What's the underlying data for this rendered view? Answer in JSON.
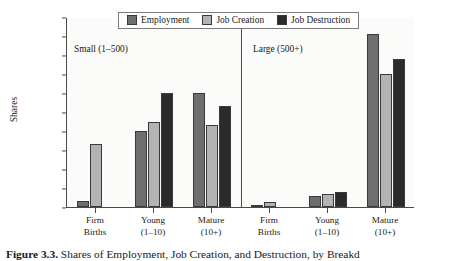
{
  "chart_data": {
    "type": "bar",
    "title": "",
    "xlabel": "",
    "ylabel": "Shares",
    "ylim": [
      0.0,
      0.5
    ],
    "ytick_step": 0.05,
    "yticks": [
      "0.50",
      "0.45",
      "0.40",
      "0.35",
      "0.30",
      "0.25",
      "0.20",
      "0.15",
      "0.10",
      "0.05",
      "0.00"
    ],
    "grid": false,
    "legend_position": "top-center",
    "legend": [
      "Employment",
      "Job Creation",
      "Job Destruction"
    ],
    "panels": [
      {
        "name": "Small (1–500)",
        "categories": [
          "Firm\nBirths",
          "Young\n(1–10)",
          "Mature\n(10+)"
        ],
        "series": [
          {
            "name": "Employment",
            "values": [
              0.015,
              0.2,
              0.3
            ]
          },
          {
            "name": "Job Creation",
            "values": [
              0.165,
              0.225,
              0.215
            ]
          },
          {
            "name": "Job Destruction",
            "values": [
              0.0,
              0.3,
              0.265
            ]
          }
        ]
      },
      {
        "name": "Large (500+)",
        "categories": [
          "Firm\nBirths",
          "Young\n(1–10)",
          "Mature\n(10+)"
        ],
        "series": [
          {
            "name": "Employment",
            "values": [
              0.003,
              0.03,
              0.455
            ]
          },
          {
            "name": "Job Creation",
            "values": [
              0.012,
              0.035,
              0.35
            ]
          },
          {
            "name": "Job Destruction",
            "values": [
              0.0,
              0.04,
              0.39
            ]
          }
        ]
      }
    ],
    "colors": {
      "employment": "#6e6e6e",
      "job_creation": "#b3b3b3",
      "job_destruction": "#2b2b2b",
      "axis": "#4a4a4a",
      "background": "#fbfbf9"
    }
  },
  "axis": {
    "ylabel": "Shares",
    "yticks": [
      "0.50",
      "0.45",
      "0.40",
      "0.35",
      "0.30",
      "0.25",
      "0.20",
      "0.15",
      "0.10",
      "0.05",
      "0.00"
    ]
  },
  "legend": {
    "items": [
      {
        "label": "Employment",
        "color": "#6e6e6e"
      },
      {
        "label": "Job Creation",
        "color": "#b3b3b3"
      },
      {
        "label": "Job Destruction",
        "color": "#2b2b2b"
      }
    ]
  },
  "panels": {
    "small": {
      "note": "Small (1–500)"
    },
    "large": {
      "note": "Large (500+)"
    }
  },
  "xlabels": [
    {
      "line1": "Firm",
      "line2": "Births"
    },
    {
      "line1": "Young",
      "line2": "(1–10)"
    },
    {
      "line1": "Mature",
      "line2": "(10+)"
    },
    {
      "line1": "Firm",
      "line2": "Births"
    },
    {
      "line1": "Young",
      "line2": "(1–10)"
    },
    {
      "line1": "Mature",
      "line2": "(10+)"
    }
  ],
  "caption": {
    "figure_number": "Figure 3.3.",
    "text": "Shares of Employment, Job Creation, and Destruction, by Breakd"
  }
}
